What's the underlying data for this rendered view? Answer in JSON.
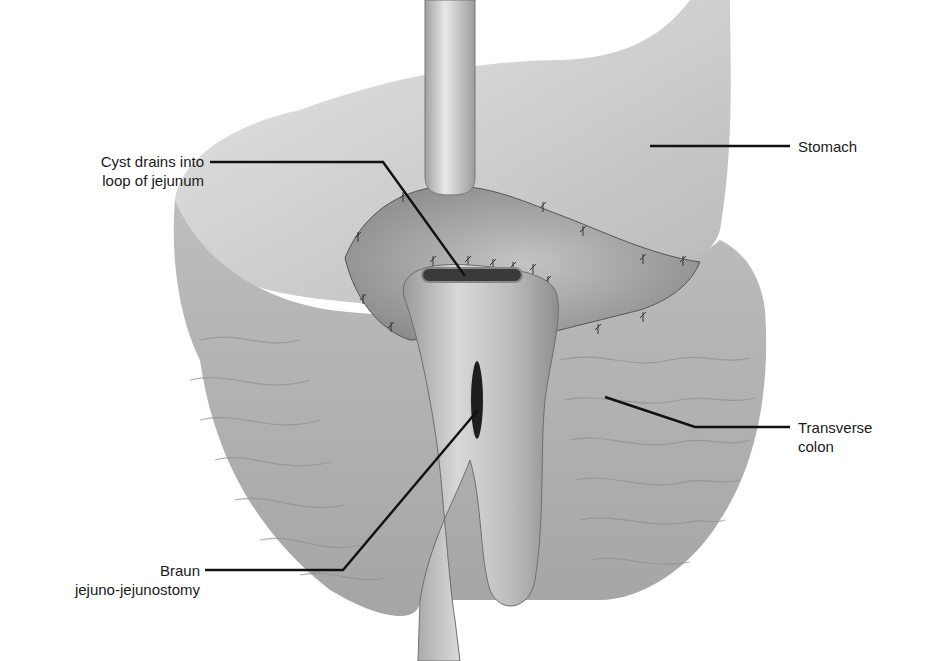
{
  "figure": {
    "style": "grayscale anatomical illustration"
  },
  "labels": {
    "stomach": "Stomach",
    "cyst_line1": "Cyst drains into",
    "cyst_line2": "loop of jejunum",
    "colon_line1": "Transverse",
    "colon_line2": "colon",
    "braun_line1": "Braun",
    "braun_line2": "jejuno-jejunostomy"
  },
  "colors": {
    "background": "#ffffff",
    "tissue_light": "#c8c8c8",
    "tissue_mid": "#a9a9a9",
    "tissue_dark": "#6e6e6e",
    "leader_line": "#111111",
    "text": "#1a1a1a"
  }
}
